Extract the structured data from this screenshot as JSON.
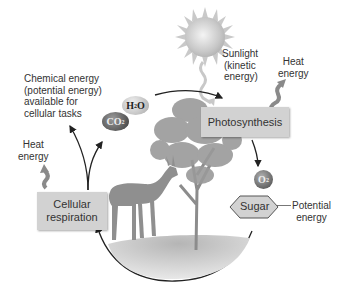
{
  "diagram": {
    "processes": {
      "photosynthesis": "Photosynthesis",
      "respiration_line1": "Cellular",
      "respiration_line2": "respiration"
    },
    "labels": {
      "sunlight": [
        "Sunlight",
        "(kinetic",
        "energy)"
      ],
      "heat_right": [
        "Heat",
        "energy"
      ],
      "heat_left": [
        "Heat",
        "energy"
      ],
      "chemical_energy": [
        "Chemical energy",
        "(potential energy)",
        "available for",
        "cellular tasks"
      ],
      "potential_energy": [
        "Potential",
        "energy"
      ],
      "sugar": "Sugar"
    },
    "molecules": {
      "water": {
        "base": "H",
        "sub": "2",
        "tail": "O"
      },
      "carbon_dioxide": {
        "base": "CO",
        "sub": "2"
      },
      "oxygen": {
        "base": "O",
        "sub": "2"
      }
    },
    "colors": {
      "process_box": "#d2d2d2",
      "arrow": "#222222",
      "heat_arrow": "#8a8a8a",
      "text": "#333333"
    }
  }
}
